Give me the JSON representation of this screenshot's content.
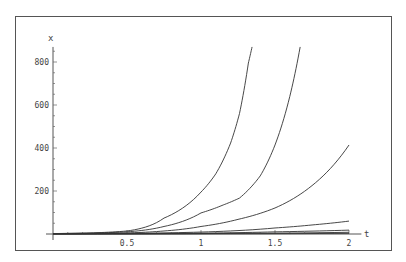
{
  "chart_data": {
    "type": "line",
    "title": "",
    "xlabel": "t",
    "ylabel": "x",
    "xlim": [
      0,
      2.05
    ],
    "ylim": [
      0,
      870
    ],
    "grid": false,
    "legend": "none",
    "x_ticks": [
      0.5,
      1,
      1.5,
      2
    ],
    "x_tick_labels": [
      "0.5",
      "1",
      "1.5",
      "2"
    ],
    "y_ticks": [
      200,
      400,
      600,
      800
    ],
    "y_tick_labels": [
      "200",
      "400",
      "600",
      "800"
    ],
    "series": [
      {
        "name": "curve-1",
        "points": [
          [
            0,
            2
          ],
          [
            0.25,
            5
          ],
          [
            0.5,
            14
          ],
          [
            0.75,
            74
          ],
          [
            1,
            195
          ],
          [
            1.1,
            280
          ],
          [
            1.2,
            423
          ],
          [
            1.26,
            560
          ],
          [
            1.32,
            795
          ],
          [
            1.345,
            870
          ]
        ]
      },
      {
        "name": "curve-2",
        "points": [
          [
            0,
            2
          ],
          [
            0.25,
            4
          ],
          [
            0.5,
            10
          ],
          [
            0.75,
            35
          ],
          [
            1,
            98
          ],
          [
            1.15,
            135
          ],
          [
            1.26,
            167
          ],
          [
            1.4,
            270
          ],
          [
            1.5,
            414
          ],
          [
            1.6,
            640
          ],
          [
            1.67,
            870
          ]
        ]
      },
      {
        "name": "curve-3",
        "points": [
          [
            0,
            1
          ],
          [
            0.5,
            5
          ],
          [
            0.75,
            14
          ],
          [
            1,
            35
          ],
          [
            1.25,
            68
          ],
          [
            1.5,
            121
          ],
          [
            1.75,
            225
          ],
          [
            2,
            414
          ]
        ]
      },
      {
        "name": "curve-4",
        "points": [
          [
            0,
            1
          ],
          [
            0.5,
            3
          ],
          [
            1,
            9
          ],
          [
            1.5,
            28
          ],
          [
            1.75,
            42
          ],
          [
            2,
            60
          ]
        ]
      },
      {
        "name": "curve-5",
        "points": [
          [
            0,
            0.5
          ],
          [
            0.5,
            1.5
          ],
          [
            1,
            4
          ],
          [
            1.5,
            10
          ],
          [
            2,
            18
          ]
        ]
      },
      {
        "name": "curve-6",
        "points": [
          [
            0,
            0.3
          ],
          [
            1,
            2
          ],
          [
            2,
            8
          ]
        ]
      },
      {
        "name": "curve-7",
        "points": [
          [
            0,
            0.1
          ],
          [
            1,
            0.8
          ],
          [
            2,
            3
          ]
        ]
      }
    ]
  }
}
